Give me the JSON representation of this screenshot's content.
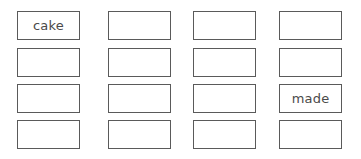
{
  "grid": {
    "rows": 4,
    "columns": 4,
    "cells": [
      [
        "cake",
        "",
        "",
        ""
      ],
      [
        "",
        "",
        "",
        ""
      ],
      [
        "",
        "",
        "",
        "made"
      ],
      [
        "",
        "",
        "",
        ""
      ]
    ]
  },
  "colors": {
    "border": "#5a5a5a",
    "text": "#4a4a4a",
    "background": "#ffffff"
  }
}
